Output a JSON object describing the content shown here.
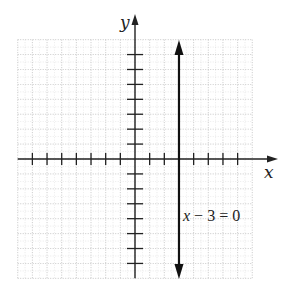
{
  "chart_data": {
    "type": "line",
    "title": "",
    "xlabel": "x",
    "ylabel": "y",
    "xlim": [
      -8,
      8
    ],
    "ylim": [
      -8,
      8
    ],
    "grid": true,
    "grid_style": "dotted",
    "x_ticks": [
      -7,
      -6,
      -5,
      -4,
      -3,
      -2,
      -1,
      1,
      2,
      3,
      4,
      5,
      6,
      7
    ],
    "y_ticks": [
      -7,
      -6,
      -5,
      -4,
      -3,
      -2,
      -1,
      1,
      2,
      3,
      4,
      5,
      6,
      7
    ],
    "tick_labels_shown": false,
    "series": [
      {
        "name": "x - 3 = 0",
        "kind": "vertical-line",
        "x": [
          3,
          3
        ],
        "y": [
          -8,
          8
        ],
        "arrows": "both"
      }
    ],
    "annotations": [
      {
        "text": "x − 3 = 0",
        "x": 3.3,
        "y": -4
      }
    ]
  },
  "labels": {
    "x_axis": "x",
    "y_axis": "y",
    "equation": "x − 3 = 0"
  },
  "colors": {
    "axis": "#222222",
    "line": "#111111",
    "grid": "#b5b5b5"
  }
}
